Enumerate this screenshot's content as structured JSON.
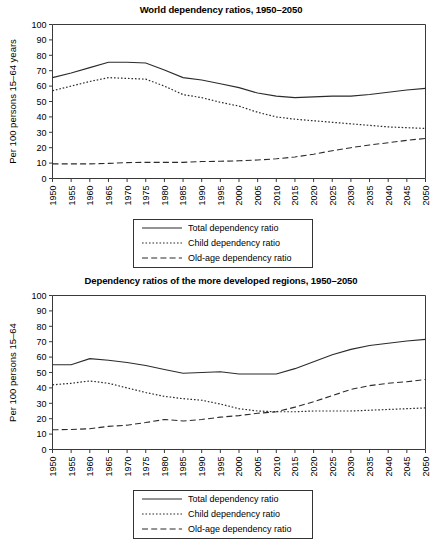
{
  "chart_data": [
    {
      "type": "line",
      "title": "World dependency ratios, 1950–2050",
      "xlabel": "",
      "ylabel": "Per 100 persons 15–64 years",
      "ylim": [
        0,
        100
      ],
      "yticks": [
        0,
        10,
        20,
        30,
        40,
        50,
        60,
        70,
        80,
        90,
        100
      ],
      "xlim": [
        1950,
        2050
      ],
      "grid": false,
      "legend_position": "below-center",
      "categories": [
        1950,
        1955,
        1960,
        1965,
        1970,
        1975,
        1980,
        1985,
        1990,
        1995,
        2000,
        2005,
        2010,
        2015,
        2020,
        2025,
        2030,
        2035,
        2040,
        2045,
        2050
      ],
      "xticklabels": [
        "1950",
        "1955",
        "1960",
        "1965",
        "1970",
        "1975",
        "1980",
        "1985",
        "1990",
        "1995",
        "2000",
        "2005",
        "2010",
        "2015",
        "2020",
        "2025",
        "2030",
        "2035",
        "2040",
        "2045",
        "2050"
      ],
      "series": [
        {
          "name": "Total dependency ratio",
          "style": "solid",
          "values": [
            65.5,
            68.5,
            72.0,
            75.5,
            75.5,
            75.0,
            70.5,
            65.5,
            64.0,
            61.5,
            59.0,
            55.5,
            53.5,
            52.5,
            53.0,
            53.5,
            53.5,
            54.5,
            56.0,
            57.5,
            58.5
          ]
        },
        {
          "name": "Child dependency ratio",
          "style": "dotted",
          "values": [
            57.0,
            60.0,
            63.0,
            65.5,
            65.0,
            64.5,
            60.0,
            54.5,
            52.5,
            49.5,
            47.0,
            43.0,
            40.0,
            38.5,
            37.5,
            36.5,
            35.5,
            34.5,
            33.5,
            33.0,
            32.5
          ]
        },
        {
          "name": "Old-age dependency ratio",
          "style": "dashed",
          "values": [
            9.5,
            9.5,
            9.5,
            9.8,
            10.3,
            10.5,
            10.5,
            10.5,
            11.0,
            11.2,
            11.5,
            12.0,
            12.8,
            14.0,
            15.8,
            18.0,
            20.0,
            21.8,
            23.2,
            24.8,
            26.0
          ]
        }
      ]
    },
    {
      "type": "line",
      "title": "Dependency ratios of the more developed regions, 1950–2050",
      "xlabel": "",
      "ylabel": "Per 100 persons 15–64",
      "ylim": [
        0,
        100
      ],
      "yticks": [
        0,
        10,
        20,
        30,
        40,
        50,
        60,
        70,
        80,
        90,
        100
      ],
      "xlim": [
        1950,
        2050
      ],
      "grid": false,
      "legend_position": "below-center",
      "categories": [
        1950,
        1955,
        1960,
        1965,
        1970,
        1975,
        1980,
        1985,
        1990,
        1995,
        2000,
        2005,
        2010,
        2015,
        2020,
        2025,
        2030,
        2035,
        2040,
        2045,
        2050
      ],
      "xticklabels": [
        "1950",
        "1955",
        "1960",
        "1965",
        "1970",
        "1975",
        "1980",
        "1985",
        "1990",
        "1995",
        "2000",
        "2005",
        "2010",
        "2015",
        "2020",
        "2025",
        "2030",
        "2035",
        "2040",
        "2045",
        "2050"
      ],
      "series": [
        {
          "name": "Total dependency ratio",
          "style": "solid",
          "values": [
            55.0,
            55.0,
            59.0,
            58.0,
            56.5,
            54.5,
            52.0,
            49.5,
            50.0,
            50.5,
            49.0,
            49.0,
            49.0,
            52.5,
            57.0,
            61.5,
            65.0,
            67.5,
            69.0,
            70.5,
            71.5
          ]
        },
        {
          "name": "Child dependency ratio",
          "style": "dotted",
          "values": [
            42.0,
            43.0,
            44.5,
            43.0,
            40.0,
            37.0,
            34.5,
            33.0,
            32.0,
            29.5,
            26.5,
            25.0,
            24.5,
            24.5,
            25.0,
            25.0,
            25.0,
            25.5,
            26.0,
            26.5,
            27.0
          ]
        },
        {
          "name": "Old-age dependency ratio",
          "style": "dashed",
          "values": [
            12.8,
            13.0,
            13.5,
            15.0,
            15.8,
            17.5,
            19.5,
            18.5,
            19.5,
            21.0,
            22.0,
            23.5,
            24.5,
            27.5,
            31.0,
            35.0,
            39.0,
            41.5,
            43.0,
            44.0,
            45.5
          ]
        }
      ]
    }
  ],
  "panels": [
    {
      "title": "World dependency ratios, 1950–2050",
      "ylabel": "Per 100 persons 15–64 years",
      "legend": [
        {
          "label": "Total dependency ratio",
          "style": "solid"
        },
        {
          "label": "Child dependency ratio",
          "style": "dotted"
        },
        {
          "label": "Old-age dependency ratio",
          "style": "dashed"
        }
      ]
    },
    {
      "title": "Dependency ratios of the more developed regions, 1950–2050",
      "ylabel": "Per 100 persons 15–64",
      "legend": [
        {
          "label": "Total dependency ratio",
          "style": "solid"
        },
        {
          "label": "Child dependency ratio",
          "style": "dotted"
        },
        {
          "label": "Old-age dependency ratio",
          "style": "dashed"
        }
      ]
    }
  ],
  "colors": {
    "ink": "#2b2b2b",
    "axis": "#3a3a3a",
    "background": "#ffffff"
  }
}
